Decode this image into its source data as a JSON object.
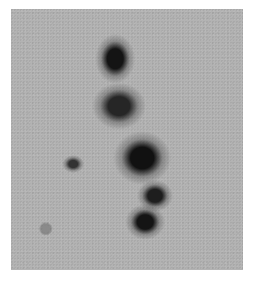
{
  "image": {
    "description": "Photographic negative plate showing a chain of dark diffuse blobs on a gray grainy background",
    "background_color": "#b3b3b3",
    "border_color": "#ffffff",
    "blobs": [
      {
        "name": "blob-top",
        "x": 115,
        "y": 59,
        "w": 22,
        "h": 28,
        "color": "#141414"
      },
      {
        "name": "blob-upper-middle",
        "x": 119,
        "y": 106,
        "w": 30,
        "h": 26,
        "color": "#262626"
      },
      {
        "name": "blob-center-large",
        "x": 142,
        "y": 158,
        "w": 32,
        "h": 30,
        "color": "#111111"
      },
      {
        "name": "blob-small-left",
        "x": 73,
        "y": 164,
        "w": 12,
        "h": 10,
        "color": "#333333"
      },
      {
        "name": "blob-right-middle",
        "x": 155,
        "y": 196,
        "w": 20,
        "h": 18,
        "color": "#1e1e1e"
      },
      {
        "name": "blob-lower",
        "x": 145,
        "y": 222,
        "w": 22,
        "h": 20,
        "color": "#141414"
      },
      {
        "name": "blob-faint-left",
        "x": 46,
        "y": 229,
        "w": 8,
        "h": 8,
        "color": "#8a8a8a"
      }
    ]
  }
}
